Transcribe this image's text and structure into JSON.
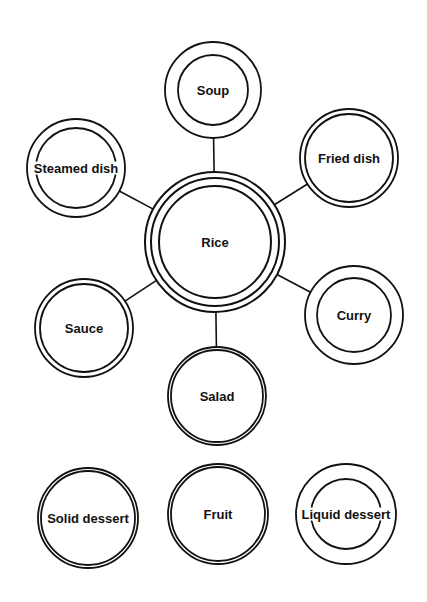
{
  "diagram": {
    "title": "",
    "center": {
      "id": "rice",
      "label": "Rice",
      "cx": 215,
      "cy": 242,
      "rings": [
        70,
        64,
        56
      ]
    },
    "nodes": [
      {
        "id": "soup",
        "label": "Soup",
        "cx": 213,
        "cy": 90,
        "rings": [
          48,
          35
        ]
      },
      {
        "id": "steamed-dish",
        "label": "Steamed dish",
        "cx": 76,
        "cy": 168,
        "rings": [
          49,
          40
        ]
      },
      {
        "id": "fried-dish",
        "label": "Fried dish",
        "cx": 349,
        "cy": 158,
        "rings": [
          49,
          44
        ]
      },
      {
        "id": "sauce",
        "label": "Sauce",
        "cx": 84,
        "cy": 328,
        "rings": [
          49,
          44
        ]
      },
      {
        "id": "curry",
        "label": "Curry",
        "cx": 354,
        "cy": 315,
        "rings": [
          49,
          37
        ]
      },
      {
        "id": "salad",
        "label": "Salad",
        "cx": 217,
        "cy": 396,
        "rings": [
          49,
          46
        ]
      },
      {
        "id": "solid-dessert",
        "label": "Solid dessert",
        "cx": 88,
        "cy": 518,
        "rings": [
          50,
          47
        ]
      },
      {
        "id": "fruit",
        "label": "Fruit",
        "cx": 218,
        "cy": 514,
        "rings": [
          50,
          47
        ]
      },
      {
        "id": "liquid-dessert",
        "label": "Liquid dessert",
        "cx": 346,
        "cy": 514,
        "rings": [
          50,
          35
        ]
      }
    ],
    "edges": [
      {
        "from": "rice",
        "to": "soup"
      },
      {
        "from": "rice",
        "to": "steamed-dish"
      },
      {
        "from": "rice",
        "to": "fried-dish"
      },
      {
        "from": "rice",
        "to": "sauce"
      },
      {
        "from": "rice",
        "to": "curry"
      },
      {
        "from": "rice",
        "to": "salad"
      }
    ],
    "colors": {
      "stroke": "#111111",
      "background": "#ffffff",
      "text": "#111111"
    }
  }
}
